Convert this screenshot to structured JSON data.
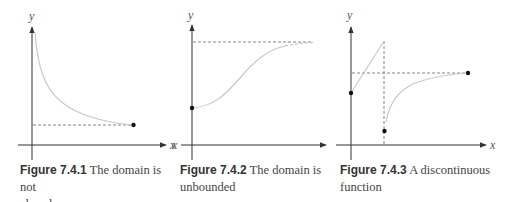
{
  "figures": [
    {
      "id": "fig-7-4-1",
      "number": "Figure 7.4.1",
      "caption": "The domain is not closed",
      "caption_line1": " The domain is not",
      "caption_line2": "closed",
      "axis_labels": {
        "x": "x",
        "y": "y"
      }
    },
    {
      "id": "fig-7-4-2",
      "number": "Figure 7.4.2",
      "caption": "The domain is unbounded",
      "caption_line1": " The domain is",
      "caption_line2": "unbounded",
      "axis_labels": {
        "x": "x",
        "y": "y"
      }
    },
    {
      "id": "fig-7-4-3",
      "number": "Figure 7.4.3",
      "caption": "A discontinuous function",
      "caption_line1": " A discontinuous",
      "caption_line2": "function",
      "axis_labels": {
        "x": "x",
        "y": "y"
      }
    }
  ],
  "colors": {
    "axis": "#333333",
    "curve": "#c8c8c8",
    "dashed": "#777777",
    "dot": "#111111"
  }
}
